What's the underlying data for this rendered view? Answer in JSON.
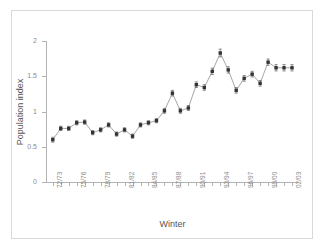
{
  "chart_data": {
    "type": "line",
    "title": "",
    "xlabel": "Winter",
    "ylabel": "Population index",
    "ylim": [
      0,
      2
    ],
    "yticks": [
      0,
      0.5,
      1,
      1.5,
      2
    ],
    "ytick_labels": [
      "0",
      "0.5",
      "1",
      "1.5",
      "2"
    ],
    "grid": false,
    "legend": "none",
    "error_bars": true,
    "marker": "filled-square",
    "line_color": "#808080",
    "marker_color": "#333333",
    "categories": [
      "72/73",
      "73/74",
      "74/75",
      "75/76",
      "76/77",
      "77/78",
      "78/79",
      "79/80",
      "80/81",
      "81/82",
      "82/83",
      "83/84",
      "84/85",
      "85/86",
      "86/87",
      "87/88",
      "88/89",
      "89/90",
      "90/91",
      "91/92",
      "92/93",
      "93/94",
      "94/95",
      "95/96",
      "96/97",
      "97/98",
      "98/99",
      "99/00",
      "00/01",
      "01/02",
      "02/03"
    ],
    "xtick_labels": [
      "72/73",
      "75/76",
      "78/79",
      "81/82",
      "84/85",
      "87/88",
      "90/91",
      "93/94",
      "96/97",
      "99/00",
      "02/03"
    ],
    "xtick_label_indices": [
      0,
      3,
      6,
      9,
      12,
      15,
      18,
      21,
      24,
      27,
      30
    ],
    "values": [
      0.6,
      0.76,
      0.76,
      0.84,
      0.85,
      0.7,
      0.74,
      0.81,
      0.68,
      0.74,
      0.65,
      0.81,
      0.84,
      0.87,
      1.01,
      1.26,
      1.01,
      1.05,
      1.38,
      1.34,
      1.57,
      1.83,
      1.59,
      1.3,
      1.47,
      1.53,
      1.4,
      1.7,
      1.62,
      1.62,
      1.62
    ],
    "errors": [
      0.035,
      0.03,
      0.03,
      0.03,
      0.03,
      0.03,
      0.03,
      0.03,
      0.03,
      0.03,
      0.03,
      0.03,
      0.03,
      0.03,
      0.035,
      0.04,
      0.035,
      0.035,
      0.04,
      0.04,
      0.045,
      0.055,
      0.045,
      0.04,
      0.04,
      0.04,
      0.04,
      0.045,
      0.045,
      0.045,
      0.045
    ]
  },
  "axes": {
    "x_title": "Winter",
    "y_title": "Population index"
  }
}
